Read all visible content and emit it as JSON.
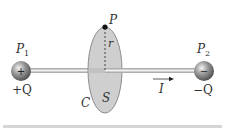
{
  "figure": {
    "labels": {
      "p1": "P",
      "p1_sub": "1",
      "p2": "P",
      "p2_sub": "2",
      "plus_q": "+Q",
      "minus_q": "−Q",
      "point_p": "P",
      "radius": "r",
      "curve": "C",
      "surface": "S",
      "current": "I"
    },
    "charges": {
      "left_sign": "+",
      "right_sign": "−"
    },
    "colors": {
      "disk_fill": "#c9c9c9",
      "disk_stroke": "#888888",
      "wire": "#bdbdbd",
      "sphere": "#8a8a8a",
      "rule": "#d6d6d6"
    }
  }
}
